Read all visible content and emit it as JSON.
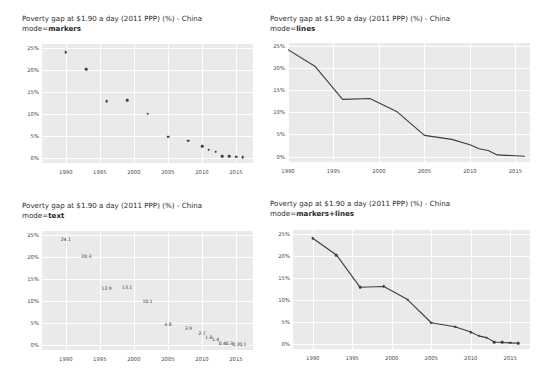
{
  "page": {
    "background": "#ffffff",
    "width": 543,
    "height": 380
  },
  "style": {
    "plot_background": "#eaeaea",
    "gridline_color": "#ffffff",
    "series_color": "#3d3d3d",
    "text_color": "#2a2a2a",
    "tick_color": "#4a4a4a"
  },
  "panels": [
    {
      "id": "markers",
      "title_line1": "Poverty gap at $1.90 a day (2011 PPP) (%) - China",
      "title_prefix": "mode=",
      "title_mode": "markers",
      "mode": "markers"
    },
    {
      "id": "lines",
      "title_line1": "Poverty gap at $1.90 a day (2011 PPP) (%) - China",
      "title_prefix": "mode=",
      "title_mode": "lines",
      "mode": "lines"
    },
    {
      "id": "text",
      "title_line1": "Poverty gap at $1.90 a day (2011 PPP) (%) - China",
      "title_prefix": "mode=",
      "title_mode": "text",
      "mode": "text"
    },
    {
      "id": "markers-lines",
      "title_line1": "Poverty gap at $1.90 a day (2011 PPP) (%) - China",
      "title_prefix": "mode=",
      "title_mode": "markers+lines",
      "mode": "markers+lines"
    }
  ],
  "chart_data": [
    {
      "type": "scatter",
      "panel": "markers",
      "title": "Poverty gap at $1.90 a day (2011 PPP) (%) - China",
      "subtitle": "mode=markers",
      "mode": "markers",
      "xlabel": "",
      "ylabel": "",
      "x": [
        1990,
        1993,
        1996,
        1999,
        2002,
        2005,
        2008,
        2010,
        2011,
        2012,
        2013,
        2014,
        2015,
        2016
      ],
      "values": [
        24.1,
        20.3,
        12.9,
        13.1,
        10.1,
        4.8,
        3.9,
        2.7,
        1.8,
        1.4,
        0.4,
        0.3,
        0.2,
        0.1
      ],
      "xlim": [
        1986.5,
        2017.5
      ],
      "ylim": [
        -1.2,
        26.0
      ],
      "xticks": [
        1990,
        1995,
        2000,
        2005,
        2010,
        2015
      ],
      "xticklabels": [
        "1990",
        "1995",
        "2000",
        "2005",
        "2010",
        "2015"
      ],
      "yticks": [
        0,
        5,
        10,
        15,
        20,
        25
      ],
      "yticklabels": [
        "0%",
        "5%",
        "10%",
        "15%",
        "20%",
        "25%"
      ],
      "grid": true,
      "legend": "none"
    },
    {
      "type": "line",
      "panel": "lines",
      "title": "Poverty gap at $1.90 a day (2011 PPP) (%) - China",
      "subtitle": "mode=lines",
      "mode": "lines",
      "xlabel": "",
      "ylabel": "",
      "x": [
        1990,
        1993,
        1996,
        1999,
        2002,
        2005,
        2008,
        2010,
        2011,
        2012,
        2013,
        2014,
        2015,
        2016
      ],
      "values": [
        24.1,
        20.3,
        12.9,
        13.1,
        10.1,
        4.8,
        3.9,
        2.7,
        1.8,
        1.4,
        0.4,
        0.3,
        0.2,
        0.1
      ],
      "xlim": [
        1990,
        2016.6
      ],
      "ylim": [
        -1.2,
        25.6
      ],
      "xticks": [
        1990,
        1995,
        2000,
        2005,
        2010,
        2015
      ],
      "xticklabels": [
        "1990",
        "1995",
        "2000",
        "2005",
        "2010",
        "2015"
      ],
      "yticks": [
        0,
        5,
        10,
        15,
        20,
        25
      ],
      "yticklabels": [
        "0%",
        "5%",
        "10%",
        "15%",
        "20%",
        "25%"
      ],
      "grid": true,
      "legend": "none"
    },
    {
      "type": "scatter",
      "panel": "text",
      "title": "Poverty gap at $1.90 a day (2011 PPP) (%) - China",
      "subtitle": "mode=text",
      "mode": "text",
      "xlabel": "",
      "ylabel": "",
      "x": [
        1990,
        1993,
        1996,
        1999,
        2002,
        2005,
        2008,
        2010,
        2011,
        2012,
        2013,
        2014,
        2015,
        2016
      ],
      "values": [
        24.1,
        20.3,
        12.9,
        13.1,
        10.1,
        4.8,
        3.9,
        2.7,
        1.8,
        1.4,
        0.4,
        0.3,
        0.2,
        0.1
      ],
      "datalabels": [
        "24.1",
        "20.3",
        "12.9",
        "13.1",
        "10.1",
        "4.8",
        "3.9",
        "2.7",
        "1.8",
        "1.4",
        "0.4",
        "0.3",
        "0.2",
        "0.1"
      ],
      "xlim": [
        1986.5,
        2017.5
      ],
      "ylim": [
        -1.2,
        26.0
      ],
      "xticks": [
        1990,
        1995,
        2000,
        2005,
        2010,
        2015
      ],
      "xticklabels": [
        "1990",
        "1995",
        "2000",
        "2005",
        "2010",
        "2015"
      ],
      "yticks": [
        0,
        5,
        10,
        15,
        20,
        25
      ],
      "yticklabels": [
        "0%",
        "5%",
        "10%",
        "15%",
        "20%",
        "25%"
      ],
      "grid": true,
      "legend": "none"
    },
    {
      "type": "line",
      "panel": "markers-lines",
      "title": "Poverty gap at $1.90 a day (2011 PPP) (%) - China",
      "subtitle": "mode=markers+lines",
      "mode": "markers+lines",
      "xlabel": "",
      "ylabel": "",
      "x": [
        1990,
        1993,
        1996,
        1999,
        2002,
        2005,
        2008,
        2010,
        2011,
        2012,
        2013,
        2014,
        2015,
        2016
      ],
      "values": [
        24.1,
        20.3,
        12.9,
        13.1,
        10.1,
        4.8,
        3.9,
        2.7,
        1.8,
        1.4,
        0.4,
        0.3,
        0.2,
        0.1
      ],
      "xlim": [
        1987.5,
        2017.5
      ],
      "ylim": [
        -1.2,
        26.0
      ],
      "xticks": [
        1990,
        1995,
        2000,
        2005,
        2010,
        2015
      ],
      "xticklabels": [
        "1990",
        "1995",
        "2000",
        "2005",
        "2010",
        "2015"
      ],
      "yticks": [
        0,
        5,
        10,
        15,
        20,
        25
      ],
      "yticklabels": [
        "0%",
        "5%",
        "10%",
        "15%",
        "20%",
        "25%"
      ],
      "grid": true,
      "legend": "none"
    }
  ]
}
